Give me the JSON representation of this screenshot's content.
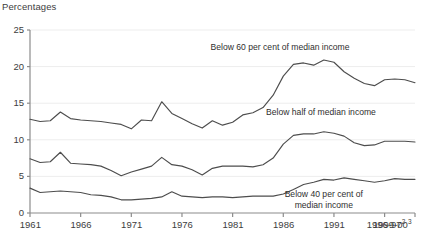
{
  "chart_data": {
    "type": "line",
    "title": "Percentages",
    "xlabel": "",
    "ylabel": "",
    "ylim": [
      0,
      25
    ],
    "ytick_values": [
      0,
      5,
      10,
      15,
      20,
      25
    ],
    "ytick_labels": [
      "0",
      "5",
      "10",
      "15",
      "20",
      "25"
    ],
    "grid": true,
    "grid_axis": "y",
    "legend_position": "inline-annotations",
    "xtick_labels": [
      "1961",
      "1966",
      "1971",
      "1976",
      "1981",
      "1986",
      "1991",
      "1996-97",
      "1999-00"
    ],
    "xtick_superscripts": [
      "",
      "",
      "",
      "",
      "",
      "",
      "",
      "2",
      "3"
    ],
    "x": [
      1961,
      1962,
      1963,
      1964,
      1965,
      1966,
      1967,
      1968,
      1969,
      1970,
      1971,
      1972,
      1973,
      1974,
      1975,
      1976,
      1977,
      1978,
      1979,
      1980,
      1981,
      1982,
      1983,
      1984,
      1985,
      1986,
      1987,
      1988,
      1989,
      1990,
      1991,
      1992,
      1993,
      1994,
      1995,
      1996,
      1997,
      1998,
      1999
    ],
    "series": [
      {
        "name": "Below 60 per cent of median income",
        "color": "#4d4d4d",
        "values": [
          12.8,
          12.5,
          12.6,
          13.8,
          12.9,
          12.7,
          12.6,
          12.5,
          12.3,
          12.1,
          11.5,
          12.7,
          12.6,
          15.2,
          13.6,
          12.9,
          12.2,
          11.6,
          12.6,
          12.0,
          12.4,
          13.4,
          13.7,
          14.4,
          16.1,
          18.7,
          20.3,
          20.5,
          20.2,
          20.9,
          20.6,
          19.3,
          18.4,
          17.7,
          17.4,
          18.2,
          18.3,
          18.2,
          17.8
        ]
      },
      {
        "name": "Below half of median income",
        "color": "#4d4d4d",
        "values": [
          7.4,
          6.9,
          7.0,
          8.3,
          6.8,
          6.7,
          6.6,
          6.4,
          5.8,
          5.1,
          5.6,
          6.0,
          6.4,
          7.6,
          6.6,
          6.4,
          5.9,
          5.2,
          6.1,
          6.4,
          6.4,
          6.4,
          6.3,
          6.6,
          7.5,
          9.4,
          10.6,
          10.8,
          10.8,
          11.1,
          10.9,
          10.5,
          9.6,
          9.2,
          9.3,
          9.8,
          9.8,
          9.8,
          9.7
        ]
      },
      {
        "name": "Below 40 per cent of median income",
        "color": "#4d4d4d",
        "values": [
          3.4,
          2.8,
          2.9,
          3.0,
          2.9,
          2.8,
          2.5,
          2.4,
          2.2,
          1.8,
          1.8,
          1.9,
          2.0,
          2.2,
          2.9,
          2.3,
          2.2,
          2.1,
          2.2,
          2.2,
          2.1,
          2.2,
          2.3,
          2.3,
          2.3,
          2.6,
          3.2,
          3.9,
          4.2,
          4.6,
          4.5,
          4.8,
          4.6,
          4.4,
          4.2,
          4.4,
          4.7,
          4.6,
          4.6
        ]
      }
    ],
    "annotations": [
      {
        "text": "Below 60 per cent of median income",
        "x": 1986,
        "y": 22.6
      },
      {
        "text": "Below half of median income",
        "x": 1990,
        "y": 13.6
      },
      {
        "text": "Below 40 per cent of median income",
        "x": 1990,
        "y": 2.4
      }
    ]
  },
  "axis": {
    "title": "Percentages"
  },
  "colors": {
    "line": "#4d4d4d",
    "axis": "#8c8c8c",
    "grid": "#ededed",
    "text": "#3d3d3d"
  }
}
